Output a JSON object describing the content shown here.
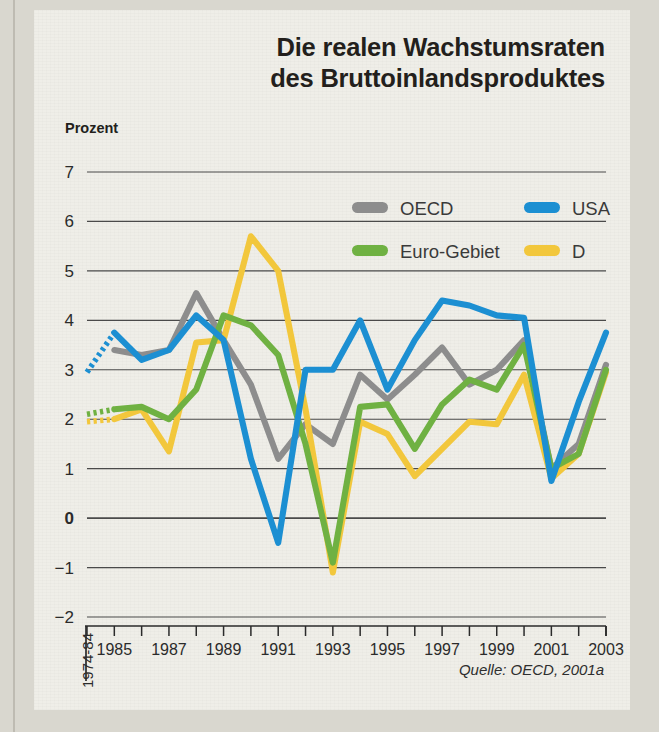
{
  "figure": {
    "title_line1": "Die realen Wachstumsraten",
    "title_line2": "des Bruttoinlandsproduktes",
    "y_axis_label": "Prozent",
    "source": "Quelle: OECD, 2001a",
    "first_x_label": "1974-84"
  },
  "colors": {
    "oecd": "#8d8d8d",
    "usa": "#1c8fd2",
    "euro": "#6fb142",
    "germany": "#f2c73c",
    "gridline": "#4a4a4a",
    "axis": "#2b2b2b",
    "background": "#efeee8",
    "page": "#d9d7cf",
    "text": "#231f1c"
  },
  "legend": {
    "position": "top-center",
    "entries": [
      {
        "label": "OECD",
        "color": "#8d8d8d",
        "key": "oecd"
      },
      {
        "label": "USA",
        "color": "#1c8fd2",
        "key": "usa"
      },
      {
        "label": "Euro-Gebiet",
        "color": "#6fb142",
        "key": "euro"
      },
      {
        "label": "D",
        "color": "#f2c73c",
        "key": "germany"
      }
    ]
  },
  "chart_data": {
    "type": "line",
    "title": "Die realen Wachstumsraten des Bruttoinlandsproduktes",
    "subtitle": "",
    "xlabel": "",
    "ylabel": "Prozent",
    "ylim": [
      -2,
      7
    ],
    "yticks": [
      7,
      6,
      5,
      4,
      3,
      2,
      1,
      0,
      -1,
      -2
    ],
    "ytick_labels": [
      "7",
      "6",
      "5",
      "4",
      "3",
      "2",
      "1",
      "0",
      "-1",
      "-2"
    ],
    "grid": true,
    "grid_axis": "y",
    "legend_position": "top-center",
    "x": [
      1984,
      1985,
      1986,
      1987,
      1988,
      1989,
      1990,
      1991,
      1992,
      1993,
      1994,
      1995,
      1996,
      1997,
      1998,
      1999,
      2000,
      2001,
      2002,
      2003
    ],
    "x_tick_labels": [
      "1974-84",
      "1985",
      "",
      "1987",
      "",
      "1989",
      "",
      "1991",
      "",
      "1993",
      "",
      "1995",
      "",
      "1997",
      "",
      "1999",
      "",
      "2001",
      "",
      "2003"
    ],
    "x_labeled_years": [
      1985,
      1987,
      1989,
      1991,
      1993,
      1995,
      1997,
      1999,
      2001,
      2003
    ],
    "note": "First segment (1974-84 average to 1985) drawn dotted for USA, Euro-Gebiet and D.",
    "series": [
      {
        "name": "OECD",
        "color": "#8d8d8d",
        "dashed_first_segment": false,
        "values": [
          null,
          3.4,
          3.3,
          3.4,
          4.55,
          3.6,
          2.7,
          1.2,
          1.9,
          1.5,
          2.9,
          2.4,
          2.9,
          3.45,
          2.7,
          3.0,
          3.6,
          1.0,
          1.5,
          3.1
        ]
      },
      {
        "name": "USA",
        "color": "#1c8fd2",
        "dashed_first_segment": true,
        "values": [
          2.95,
          3.75,
          3.2,
          3.4,
          4.1,
          3.6,
          1.2,
          -0.5,
          3.0,
          3.0,
          4.0,
          2.6,
          3.6,
          4.4,
          4.3,
          4.1,
          4.05,
          0.75,
          2.35,
          3.75
        ]
      },
      {
        "name": "Euro-Gebiet",
        "color": "#6fb142",
        "dashed_first_segment": true,
        "values": [
          2.1,
          2.2,
          2.25,
          2.0,
          2.6,
          4.1,
          3.9,
          3.3,
          1.5,
          -0.9,
          2.25,
          2.3,
          1.4,
          2.3,
          2.8,
          2.6,
          3.5,
          1.0,
          1.3,
          3.0
        ]
      },
      {
        "name": "D",
        "color": "#f2c73c",
        "dashed_first_segment": true,
        "values": [
          1.95,
          2.0,
          2.2,
          1.35,
          3.55,
          3.6,
          5.7,
          5.0,
          2.2,
          -1.1,
          1.95,
          1.7,
          0.85,
          1.4,
          1.95,
          1.9,
          2.9,
          0.8,
          1.3,
          2.95
        ]
      }
    ]
  }
}
